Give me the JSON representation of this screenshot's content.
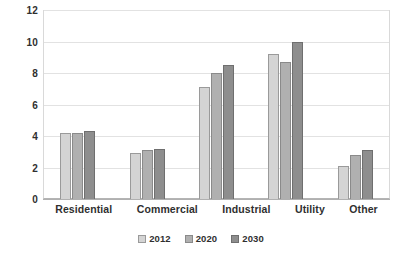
{
  "chart_data": {
    "type": "bar",
    "title": "",
    "subtitle": "",
    "xlabel": "",
    "ylabel": "",
    "categories": [
      "Residential",
      "Commercial",
      "Industrial",
      "Utility",
      "Other"
    ],
    "series": [
      {
        "name": "2012",
        "color": "#d4d4d4",
        "values": [
          4.2,
          2.9,
          7.1,
          9.2,
          2.1
        ]
      },
      {
        "name": "2020",
        "color": "#b0b0b0",
        "values": [
          4.2,
          3.1,
          8.0,
          8.7,
          2.8
        ]
      },
      {
        "name": "2030",
        "color": "#8e8e8e",
        "values": [
          4.3,
          3.2,
          8.5,
          10.0,
          3.1
        ]
      }
    ],
    "ylim": [
      0,
      12
    ],
    "yticks": [
      0,
      2,
      4,
      6,
      8,
      10,
      12
    ],
    "ytick_labels": [
      "0",
      "2",
      "4",
      "6",
      "8",
      "10",
      "12"
    ],
    "grid": true,
    "grid_axis": "y",
    "legend": true,
    "legend_position": "bottom",
    "bar_border_color": "#8d8d8d",
    "gridline_color": "#e2e2e2",
    "axis_color": "#b0b0b0",
    "text_color": "#2f2f2f",
    "background": "#ffffff"
  }
}
